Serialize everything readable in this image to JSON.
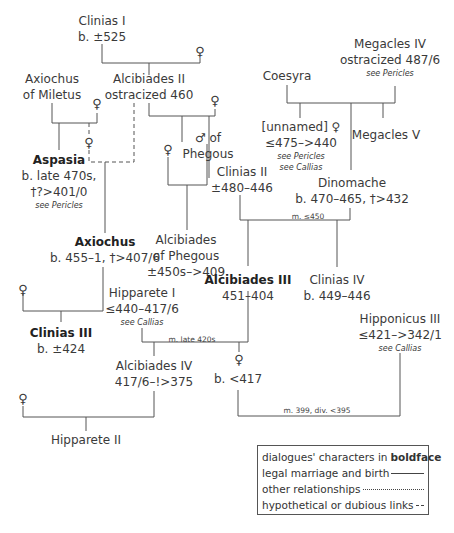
{
  "nodes": {
    "clinias1": {
      "name": "Clinias I",
      "dates": "b. ±525"
    },
    "alcibiades2": {
      "name": "Alcibiades II",
      "dates": "ostracized 460"
    },
    "axiochus_miletus": {
      "name": "Axiochus",
      "line2": "of Miletus"
    },
    "megacles4": {
      "name": "Megacles IV",
      "dates": "ostracized 487/6",
      "ref": "see Pericles"
    },
    "coesyra": {
      "name": "Coesyra"
    },
    "unnamed": {
      "name": "[unnamed] ♀",
      "dates": "≤475–>440",
      "ref1": "see Pericles",
      "ref2": "see Callias"
    },
    "megacles5": {
      "name": "Megacles V"
    },
    "phegous_male": {
      "name": "♂ of",
      "line2": "Phegous"
    },
    "aspasia": {
      "name": "Aspasia",
      "dates": "b. late 470s,",
      "dates2": "†?>401/0",
      "ref": "see Pericles"
    },
    "clinias2": {
      "name": "Clinias II",
      "dates": "±480–446"
    },
    "dinomache": {
      "name": "Dinomache",
      "dates": "b. 470–465, †>432"
    },
    "alcibiades_phegous": {
      "name": "Alcibiades",
      "line2": "of Phegous",
      "dates": "±450s–>409"
    },
    "axiochus": {
      "name": "Axiochus",
      "dates": "b. 455–1, †>407/6"
    },
    "alcibiades3": {
      "name": "Alcibiades III",
      "dates": "451–404"
    },
    "clinias4": {
      "name": "Clinias IV",
      "dates": "b. 449–446"
    },
    "hipparete1": {
      "name": "Hipparete I",
      "dates": "≤440–417/6",
      "ref": "see Callias"
    },
    "clinias3": {
      "name": "Clinias III",
      "dates": "b. ±424"
    },
    "hipponicus3": {
      "name": "Hipponicus III",
      "dates": "≤421–>342/1",
      "ref": "see Callias"
    },
    "alcibiades4": {
      "name": "Alcibiades IV",
      "dates": "417/6–!>375"
    },
    "daughter": {
      "dates": "b. <417"
    },
    "hipparete2": {
      "name": "Hipparete II"
    }
  },
  "symbols": {
    "female": "♀"
  },
  "marriage_labels": {
    "m450": "m. ≤450",
    "m420": "m. late 420s",
    "m399": "m. 399, div. <395"
  },
  "legend": {
    "line1_prefix": "dialogues' characters in ",
    "line1_bold": "boldface",
    "line2": "legal marriage and birth",
    "line3": "other relationships",
    "line4": "hypothetical or dubious links"
  }
}
